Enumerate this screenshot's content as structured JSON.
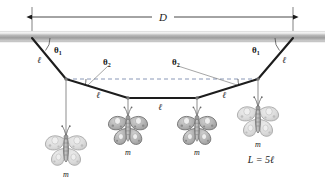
{
  "figure": {
    "background": "#ffffff",
    "ink_color": "#1a1a1a",
    "beam_color": "#9a9a9a",
    "butterfly_fill": "#b8b8b8",
    "butterfly_pale": "#d8d8d8"
  },
  "labels": {
    "span": "D",
    "segment": "ℓ",
    "mass": "m",
    "theta1": "θ",
    "theta1_sub": "1",
    "theta2": "θ",
    "theta2_sub": "2",
    "total_length": "L = 5ℓ"
  },
  "geometry": {
    "span_start_x": 32,
    "span_end_x": 293,
    "beam_y": 36,
    "dimension_line_y": 17,
    "dashed_level_y": 79,
    "nodes": [
      {
        "name": "anchor-left",
        "x": 32,
        "y": 38
      },
      {
        "name": "node-1",
        "x": 66,
        "y": 79
      },
      {
        "name": "node-2",
        "x": 128,
        "y": 98
      },
      {
        "name": "node-3",
        "x": 197,
        "y": 98
      },
      {
        "name": "node-4",
        "x": 258,
        "y": 79
      },
      {
        "name": "anchor-right",
        "x": 293,
        "y": 38
      }
    ],
    "segments": [
      {
        "name": "segment-1",
        "label": "ℓ",
        "label_x": 39,
        "label_y": 63
      },
      {
        "name": "segment-2",
        "label": "ℓ",
        "label_x": 98,
        "label_y": 98
      },
      {
        "name": "segment-3",
        "label": "ℓ",
        "label_x": 160,
        "label_y": 108
      },
      {
        "name": "segment-4",
        "label": "ℓ",
        "label_x": 222,
        "label_y": 98
      },
      {
        "name": "segment-5",
        "label": "ℓ",
        "label_x": 283,
        "label_y": 63
      }
    ],
    "butterflies": [
      {
        "name": "butterfly-left-outer",
        "x": 66,
        "y": 148,
        "drop_y": 79,
        "scale": 1.0,
        "shade": "pale",
        "label_y": 176
      },
      {
        "name": "butterfly-left-inner",
        "x": 128,
        "y": 128,
        "drop_y": 98,
        "scale": 0.95,
        "shade": "solid",
        "label_y": 154
      },
      {
        "name": "butterfly-right-inner",
        "x": 197,
        "y": 128,
        "drop_y": 98,
        "scale": 0.95,
        "shade": "solid",
        "label_y": 154
      },
      {
        "name": "butterfly-right-outer",
        "x": 258,
        "y": 119,
        "drop_y": 79,
        "scale": 1.0,
        "shade": "pale",
        "label_y": 147
      }
    ],
    "theta1_left": {
      "label_x": 56,
      "label_y": 51
    },
    "theta1_right": {
      "label_x": 256,
      "label_y": 51
    },
    "theta2_left": {
      "label_x": 108,
      "label_y": 62
    },
    "theta2_right": {
      "label_x": 178,
      "label_y": 62
    },
    "total_length_pos": {
      "x": 261,
      "y": 160
    }
  }
}
